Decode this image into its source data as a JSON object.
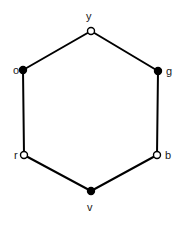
{
  "diagram": {
    "type": "undirected-cycle-graph",
    "shape": "hexagon",
    "background_color": "#ffffff",
    "edge_color": "#000000",
    "edge_width": 2,
    "node_outline_color": "#000000",
    "node_fill_filled": "#000000",
    "node_fill_hollow": "#ffffff",
    "node_radius": 3.5,
    "label_color": "#1a1a1a",
    "label_font_size": 11,
    "nodes": [
      {
        "id": "y",
        "label": "y",
        "x": 91,
        "y": 31,
        "style": "hollow",
        "position": "top",
        "label_x": 86,
        "label_y": 11
      },
      {
        "id": "g",
        "label": "g",
        "x": 158,
        "y": 71,
        "style": "filled",
        "position": "upper-right",
        "label_x": 166,
        "label_y": 66
      },
      {
        "id": "b",
        "label": "b",
        "x": 157,
        "y": 155,
        "style": "hollow",
        "position": "lower-right",
        "label_x": 165,
        "label_y": 150
      },
      {
        "id": "v",
        "label": "v",
        "x": 91,
        "y": 191,
        "style": "filled",
        "position": "bottom",
        "label_x": 87,
        "label_y": 202
      },
      {
        "id": "r",
        "label": "r",
        "x": 24,
        "y": 155,
        "style": "hollow",
        "position": "lower-left",
        "label_x": 14,
        "label_y": 150
      },
      {
        "id": "o",
        "label": "o",
        "x": 23,
        "y": 70,
        "style": "filled",
        "position": "upper-left",
        "label_x": 13,
        "label_y": 65
      }
    ],
    "edges": [
      {
        "from": "y",
        "to": "g"
      },
      {
        "from": "g",
        "to": "b"
      },
      {
        "from": "b",
        "to": "v"
      },
      {
        "from": "v",
        "to": "r"
      },
      {
        "from": "r",
        "to": "o"
      },
      {
        "from": "o",
        "to": "y"
      }
    ]
  }
}
